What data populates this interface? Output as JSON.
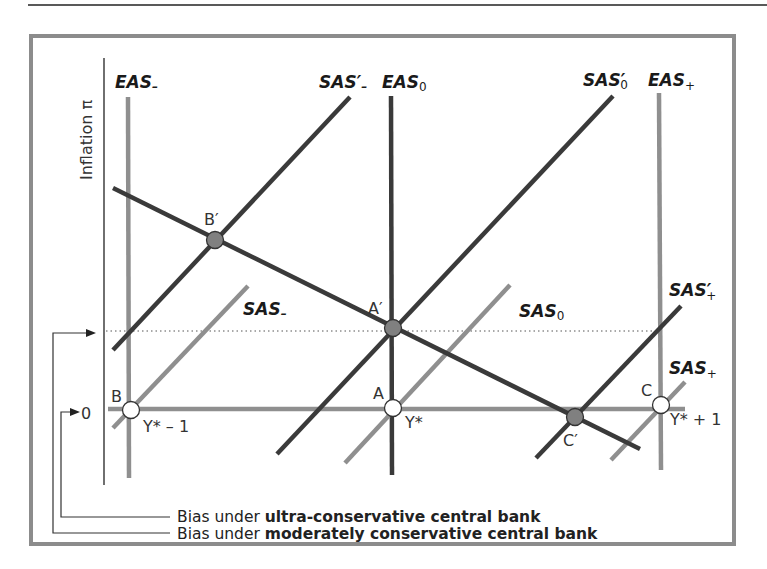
{
  "figure": {
    "y_axis_label": "Inflation π",
    "zero_label": "0",
    "colors": {
      "frame": "#8c8c8c",
      "dark_line": "#3a3a3a",
      "light_line": "#8f8f8f",
      "point_filled": "#808080",
      "point_open": "#ffffff",
      "text": "#1a1a1a"
    },
    "curves": {
      "eas_minus": {
        "base": "EAS",
        "sub": "–"
      },
      "eas_zero": {
        "base": "EAS",
        "sub": "0"
      },
      "eas_plus": {
        "base": "EAS",
        "sub": "+"
      },
      "sas_minus_prime": {
        "base": "SAS",
        "prime": "′",
        "sub": "–"
      },
      "sas_zero_prime": {
        "base": "SAS",
        "prime": "′",
        "sub": "0"
      },
      "sas_plus_prime": {
        "base": "SAS",
        "prime": "′",
        "sub": "+"
      },
      "sas_minus": {
        "base": "SAS",
        "sub": "–"
      },
      "sas_zero": {
        "base": "SAS",
        "sub": "0"
      },
      "sas_plus": {
        "base": "SAS",
        "sub": "+"
      }
    },
    "points": {
      "B": "B",
      "A": "A",
      "C": "C",
      "B_prime": "B′",
      "A_prime": "A′",
      "C_prime": "C′"
    },
    "output_labels": {
      "y_minus": "Y* – 1",
      "y_star": "Y*",
      "y_plus": "Y* + 1"
    },
    "legend": [
      {
        "prefix": "Bias under ",
        "bold": "ultra-conservative central bank"
      },
      {
        "prefix": "Bias under ",
        "bold": "moderately conservative central bank"
      }
    ]
  }
}
